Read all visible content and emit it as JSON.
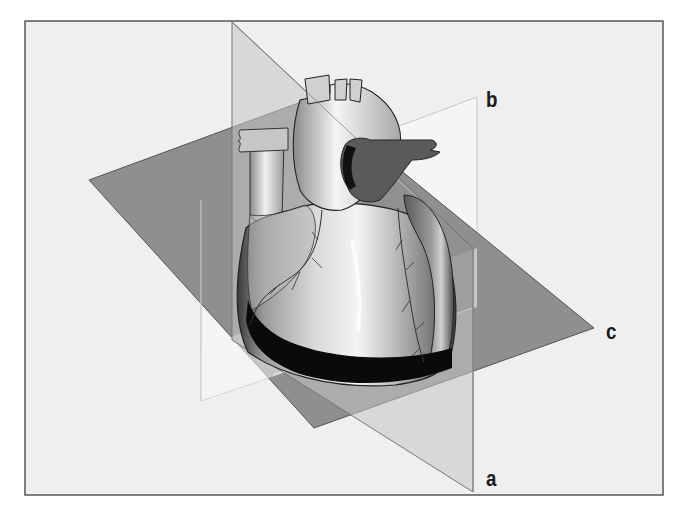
{
  "figure": {
    "colors": {
      "frame_bg": "#efefef",
      "frame_border": "#555555",
      "plane_c": "#8f8f8f",
      "plane_a": "#bdbdbd",
      "plane_b": "#f6f6f6",
      "band": "#0a0a0a"
    }
  },
  "planes": [
    {
      "id": "a",
      "label": "a"
    },
    {
      "id": "b",
      "label": "b"
    },
    {
      "id": "c",
      "label": "c"
    }
  ]
}
